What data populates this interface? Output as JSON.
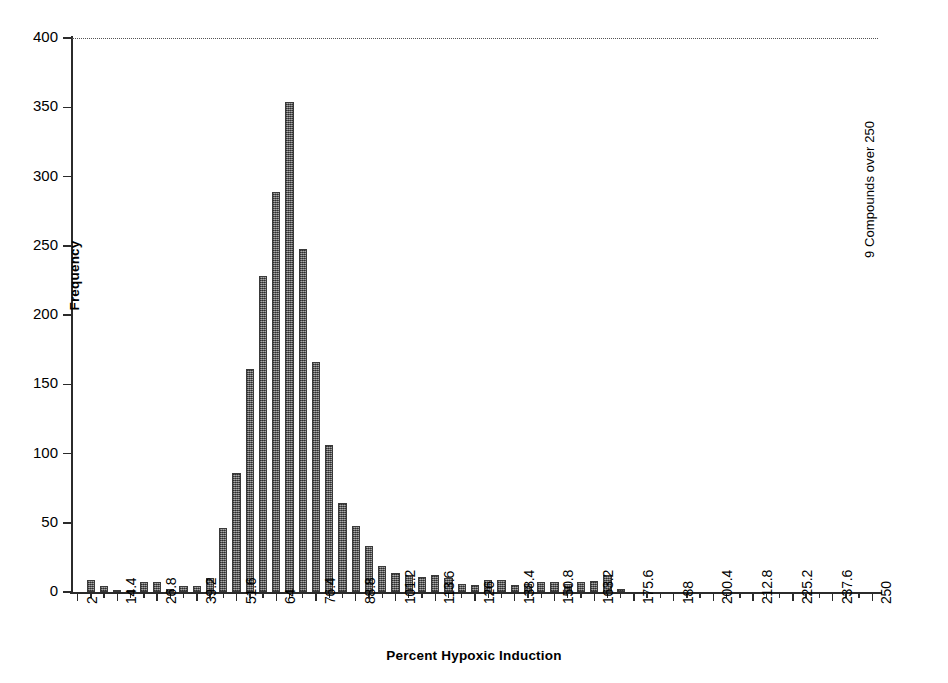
{
  "chart_data": {
    "type": "bar",
    "title": "",
    "xlabel": "Percent Hypoxic Induction",
    "ylabel": "Frequency",
    "ylim": [
      0,
      400
    ],
    "ytick_labels": [
      "0",
      "50",
      "100",
      "150",
      "200",
      "250",
      "300",
      "350",
      "400"
    ],
    "ytick_values": [
      0,
      50,
      100,
      150,
      200,
      250,
      300,
      350,
      400
    ],
    "grid": "top-dotted-line-at-400",
    "legend": "none",
    "bin_width": 4.1333,
    "xtick_labels": [
      "2",
      "14.4",
      "26.8",
      "39.2",
      "51.6",
      "64",
      "76.4",
      "88.8",
      "101.2",
      "113.6",
      "126",
      "138.4",
      "150.8",
      "163.2",
      "175.6",
      "188",
      "200.4",
      "212.8",
      "225.2",
      "237.6",
      "250"
    ],
    "xtick_values": [
      2,
      14.4,
      26.8,
      39.2,
      51.6,
      64,
      76.4,
      88.8,
      101.2,
      113.6,
      126,
      138.4,
      150.8,
      163.2,
      175.6,
      188,
      200.4,
      212.8,
      225.2,
      237.6,
      250
    ],
    "xtick_every_n_bars": 3,
    "x": [
      2,
      6.13,
      10.27,
      14.4,
      18.53,
      22.67,
      26.8,
      30.93,
      35.07,
      39.2,
      43.33,
      47.47,
      51.6,
      55.73,
      59.87,
      64,
      68.13,
      72.27,
      76.4,
      80.53,
      84.67,
      88.8,
      92.93,
      97.07,
      101.2,
      105.33,
      109.47,
      113.6,
      117.73,
      121.87,
      126,
      130.13,
      134.27,
      138.4,
      142.53,
      146.67,
      150.8,
      154.93,
      159.07,
      163.2,
      167.33,
      171.47,
      175.6,
      179.73,
      183.87,
      188,
      192.13,
      196.27,
      200.4,
      204.53,
      208.67,
      212.8,
      216.93,
      221.07,
      225.2,
      229.33,
      233.47,
      237.6,
      241.73,
      245.87,
      250
    ],
    "values": [
      0,
      9,
      4,
      1,
      1,
      7,
      7,
      2,
      4,
      4,
      10,
      46,
      86,
      161,
      228,
      289,
      354,
      248,
      166,
      106,
      64,
      48,
      33,
      19,
      14,
      12,
      11,
      12,
      10,
      6,
      5,
      9,
      9,
      5,
      6,
      7,
      7,
      6,
      7,
      8,
      12,
      2,
      0,
      0,
      0,
      0,
      0,
      0,
      0,
      0,
      0,
      0,
      0,
      0,
      0,
      0,
      0,
      0,
      0,
      0,
      0
    ],
    "annotation": "9 Compounds over 250",
    "bar_color": "#6e6e6e",
    "bar_border_color": "#3a3a3a",
    "axis_color": "#2b2b2b"
  }
}
